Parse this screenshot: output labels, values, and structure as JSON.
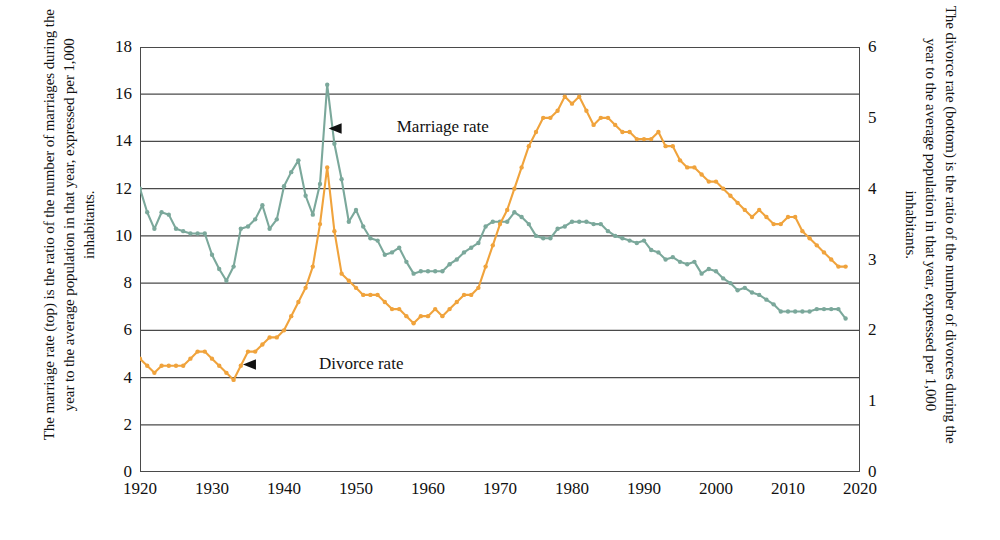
{
  "captions": {
    "left": "The marriage rate (top) is the ratio of the number of marriages during the year to the average population in that year, expressed per 1,000 inhabitants.",
    "right": "The divorce rate (bottom) is the ratio of the number of divorces during the year to the average population in that year, expressed per 1,000 inhabitants."
  },
  "colors": {
    "marriage": "#7BA89B",
    "divorce": "#F0A33C",
    "grid": "#4a4a4a",
    "frame": "#4a4a4a",
    "annotation": "#111111"
  },
  "annotations": [
    {
      "name": "marriage-rate",
      "label": "Marriage rate",
      "x": 1947.6,
      "y": 14.55,
      "arrow_to_x": 1946.2,
      "arrow_to_y": 14.55
    },
    {
      "name": "divorce-rate",
      "label": "Divorce rate",
      "x": 1936.8,
      "y": 4.55,
      "arrow_to_x": 1934.3,
      "arrow_to_y": 4.55
    }
  ],
  "chart_data": {
    "type": "line",
    "title": "",
    "xlabel": "",
    "ylabel": "",
    "grid": true,
    "legend": "annotations-inline",
    "x": [
      1920,
      1921,
      1922,
      1923,
      1924,
      1925,
      1926,
      1927,
      1928,
      1929,
      1930,
      1931,
      1932,
      1933,
      1934,
      1935,
      1936,
      1937,
      1938,
      1939,
      1940,
      1941,
      1942,
      1943,
      1944,
      1945,
      1946,
      1947,
      1948,
      1949,
      1950,
      1951,
      1952,
      1953,
      1954,
      1955,
      1956,
      1957,
      1958,
      1959,
      1960,
      1961,
      1962,
      1963,
      1964,
      1965,
      1966,
      1967,
      1968,
      1969,
      1970,
      1971,
      1972,
      1973,
      1974,
      1975,
      1976,
      1977,
      1978,
      1979,
      1980,
      1981,
      1982,
      1983,
      1984,
      1985,
      1986,
      1987,
      1988,
      1989,
      1990,
      1991,
      1992,
      1993,
      1994,
      1995,
      1996,
      1997,
      1998,
      1999,
      2000,
      2001,
      2002,
      2003,
      2004,
      2005,
      2006,
      2007,
      2008,
      2009,
      2010,
      2011,
      2012,
      2013,
      2014,
      2015,
      2016,
      2017,
      2018
    ],
    "xlim": [
      1920,
      2020
    ],
    "xticks": [
      1920,
      1930,
      1940,
      1950,
      1960,
      1970,
      1980,
      1990,
      2000,
      2010,
      2020
    ],
    "axes": {
      "left": {
        "name": "marriage-rate-axis",
        "ylim": [
          0,
          18
        ],
        "yticks": [
          0,
          2,
          4,
          6,
          8,
          10,
          12,
          14,
          16,
          18
        ],
        "units": "per 1,000 inhabitants"
      },
      "right": {
        "name": "divorce-rate-axis",
        "ylim": [
          0,
          6
        ],
        "yticks": [
          0,
          1,
          2,
          3,
          4,
          5,
          6
        ],
        "units": "per 1,000 inhabitants"
      }
    },
    "series": [
      {
        "name": "Marriage rate",
        "axis": "left",
        "color": "#7BA89B",
        "values": [
          12.0,
          11.0,
          10.3,
          11.0,
          10.9,
          10.3,
          10.2,
          10.1,
          10.1,
          10.1,
          9.2,
          8.6,
          8.1,
          8.7,
          10.3,
          10.4,
          10.7,
          11.3,
          10.3,
          10.7,
          12.1,
          12.7,
          13.2,
          11.7,
          10.9,
          12.2,
          16.4,
          13.9,
          12.4,
          10.6,
          11.1,
          10.4,
          9.9,
          9.8,
          9.2,
          9.3,
          9.5,
          8.9,
          8.4,
          8.5,
          8.5,
          8.5,
          8.5,
          8.8,
          9.0,
          9.3,
          9.5,
          9.7,
          10.4,
          10.6,
          10.6,
          10.6,
          11.0,
          10.8,
          10.5,
          10.0,
          9.9,
          9.9,
          10.3,
          10.4,
          10.6,
          10.6,
          10.6,
          10.5,
          10.5,
          10.2,
          10.0,
          9.9,
          9.8,
          9.7,
          9.8,
          9.4,
          9.3,
          9.0,
          9.1,
          8.9,
          8.8,
          8.9,
          8.4,
          8.6,
          8.5,
          8.2,
          8.0,
          7.7,
          7.8,
          7.6,
          7.5,
          7.3,
          7.1,
          6.8,
          6.8,
          6.8,
          6.8,
          6.8,
          6.9,
          6.9,
          6.9,
          6.9,
          6.5
        ]
      },
      {
        "name": "Divorce rate",
        "axis": "right",
        "color": "#F0A33C",
        "values": [
          1.6,
          1.5,
          1.4,
          1.5,
          1.5,
          1.5,
          1.5,
          1.6,
          1.7,
          1.7,
          1.6,
          1.5,
          1.4,
          1.3,
          1.5,
          1.7,
          1.7,
          1.8,
          1.9,
          1.9,
          2.0,
          2.2,
          2.4,
          2.6,
          2.9,
          3.5,
          4.3,
          3.4,
          2.8,
          2.7,
          2.6,
          2.5,
          2.5,
          2.5,
          2.4,
          2.3,
          2.3,
          2.2,
          2.1,
          2.2,
          2.2,
          2.3,
          2.2,
          2.3,
          2.4,
          2.5,
          2.5,
          2.6,
          2.9,
          3.2,
          3.5,
          3.7,
          4.0,
          4.3,
          4.6,
          4.8,
          5.0,
          5.0,
          5.1,
          5.3,
          5.2,
          5.3,
          5.1,
          4.9,
          5.0,
          5.0,
          4.9,
          4.8,
          4.8,
          4.7,
          4.7,
          4.7,
          4.8,
          4.6,
          4.6,
          4.4,
          4.3,
          4.3,
          4.2,
          4.1,
          4.1,
          4.0,
          3.9,
          3.8,
          3.7,
          3.6,
          3.7,
          3.6,
          3.5,
          3.5,
          3.6,
          3.6,
          3.4,
          3.3,
          3.2,
          3.1,
          3.0,
          2.9,
          2.9
        ]
      }
    ]
  }
}
